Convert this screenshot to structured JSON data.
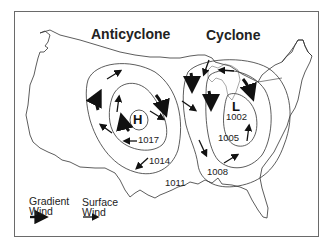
{
  "diagram": {
    "titles": {
      "anticyclone": "Anticyclone",
      "cyclone": "Cyclone"
    },
    "centers": {
      "high": "H",
      "low": "L"
    },
    "isobars": {
      "high_inner": "1017",
      "high_outer": "1014",
      "between": "1011",
      "low_inner": "1002",
      "low_middle": "1005",
      "low_outer": "1008"
    },
    "legend": {
      "gradient_wind": "Gradient\nWind",
      "gradient_line1": "Gradient",
      "gradient_line2": "Wind",
      "surface_line1": "Surface",
      "surface_line2": "Wind"
    },
    "colors": {
      "line": "#333333",
      "arrow": "#111111",
      "frame": "#6a6a6a"
    }
  }
}
